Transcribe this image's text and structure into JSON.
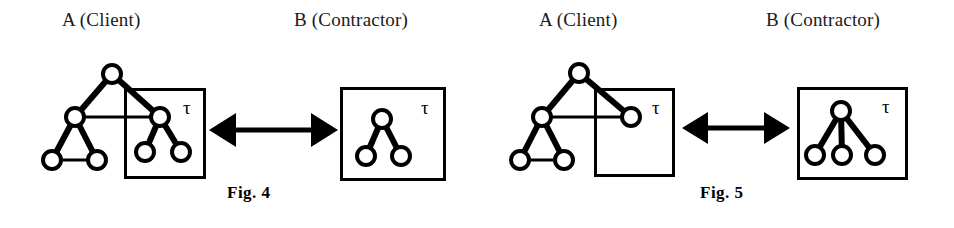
{
  "page": {
    "width": 954,
    "height": 228,
    "background": "#ffffff",
    "ink": "#000000"
  },
  "figures": [
    {
      "id": "fig4",
      "caption": "Fig.  4",
      "caption_x": 227,
      "caption_y": 183,
      "labels": {
        "client": "A (Client)",
        "client_x": 62,
        "client_y": 9,
        "contractor": "B (Contractor)",
        "contractor_x": 294,
        "contractor_y": 9
      },
      "client_side": {
        "tau_label": "τ",
        "tau_x": 183,
        "tau_y": 95,
        "box": {
          "x": 124,
          "y": 88,
          "w": 79,
          "h": 88
        },
        "nodes": [
          {
            "id": "root",
            "cx": 112,
            "cy": 74,
            "r": 9
          },
          {
            "id": "mid",
            "cx": 75,
            "cy": 117,
            "r": 9
          },
          {
            "id": "bl",
            "cx": 52,
            "cy": 160,
            "r": 9
          },
          {
            "id": "br",
            "cx": 97,
            "cy": 160,
            "r": 9
          },
          {
            "id": "sub",
            "cx": 160,
            "cy": 117,
            "r": 9
          },
          {
            "id": "subl",
            "cx": 145,
            "cy": 152,
            "r": 9
          },
          {
            "id": "subr",
            "cx": 181,
            "cy": 152,
            "r": 9
          }
        ],
        "edges": [
          {
            "from": "root",
            "to": "mid",
            "weight": "thick"
          },
          {
            "from": "root",
            "to": "sub",
            "weight": "thick"
          },
          {
            "from": "mid",
            "to": "bl",
            "weight": "thick"
          },
          {
            "from": "mid",
            "to": "br",
            "weight": "thick"
          },
          {
            "from": "bl",
            "to": "br",
            "weight": "thin"
          },
          {
            "from": "mid",
            "to": "sub",
            "weight": "thin"
          },
          {
            "from": "sub",
            "to": "subl",
            "weight": "thick"
          },
          {
            "from": "sub",
            "to": "subr",
            "weight": "thick"
          }
        ]
      },
      "contractor_side": {
        "tau_label": "τ",
        "tau_x": 421,
        "tau_y": 95,
        "box": {
          "x": 340,
          "y": 87,
          "w": 103,
          "h": 91
        },
        "nodes": [
          {
            "id": "root",
            "cx": 382,
            "cy": 119,
            "r": 9
          },
          {
            "id": "left",
            "cx": 366,
            "cy": 156,
            "r": 9
          },
          {
            "id": "right",
            "cx": 401,
            "cy": 156,
            "r": 9
          }
        ],
        "edges": [
          {
            "from": "root",
            "to": "left",
            "weight": "thick"
          },
          {
            "from": "root",
            "to": "right",
            "weight": "thick"
          }
        ]
      },
      "arrow": {
        "x1": 209,
        "x2": 338,
        "y": 130,
        "head": 17,
        "shaft": 5
      }
    },
    {
      "id": "fig5",
      "caption": "Fig.  5",
      "caption_x": 700,
      "caption_y": 183,
      "labels": {
        "client": "A (Client)",
        "client_x": 539,
        "client_y": 9,
        "contractor": "B (Contractor)",
        "contractor_x": 766,
        "contractor_y": 9
      },
      "client_side": {
        "tau_label": "τ",
        "tau_x": 652,
        "tau_y": 95,
        "box": {
          "x": 594,
          "y": 88,
          "w": 78,
          "h": 86
        },
        "nodes": [
          {
            "id": "root",
            "cx": 579,
            "cy": 73,
            "r": 9
          },
          {
            "id": "mid",
            "cx": 542,
            "cy": 117,
            "r": 9
          },
          {
            "id": "bl",
            "cx": 520,
            "cy": 160,
            "r": 9
          },
          {
            "id": "br",
            "cx": 564,
            "cy": 160,
            "r": 9
          },
          {
            "id": "sub",
            "cx": 631,
            "cy": 117,
            "r": 9
          }
        ],
        "edges": [
          {
            "from": "root",
            "to": "mid",
            "weight": "thick"
          },
          {
            "from": "root",
            "to": "sub",
            "weight": "thick"
          },
          {
            "from": "mid",
            "to": "bl",
            "weight": "thick"
          },
          {
            "from": "mid",
            "to": "br",
            "weight": "thick"
          },
          {
            "from": "bl",
            "to": "br",
            "weight": "thin"
          },
          {
            "from": "mid",
            "to": "sub",
            "weight": "thin"
          }
        ]
      },
      "contractor_side": {
        "tau_label": "τ",
        "tau_x": 882,
        "tau_y": 94,
        "box": {
          "x": 797,
          "y": 87,
          "w": 108,
          "h": 90
        },
        "nodes": [
          {
            "id": "root",
            "cx": 841,
            "cy": 111,
            "r": 9
          },
          {
            "id": "left",
            "cx": 815,
            "cy": 155,
            "r": 9
          },
          {
            "id": "mid",
            "cx": 842,
            "cy": 155,
            "r": 9
          },
          {
            "id": "right",
            "cx": 875,
            "cy": 155,
            "r": 9
          }
        ],
        "edges": [
          {
            "from": "root",
            "to": "left",
            "weight": "thick"
          },
          {
            "from": "root",
            "to": "mid",
            "weight": "thick"
          },
          {
            "from": "root",
            "to": "right",
            "weight": "thick"
          }
        ]
      },
      "arrow": {
        "x1": 682,
        "x2": 790,
        "y": 128,
        "head": 16,
        "shaft": 5
      }
    }
  ],
  "style": {
    "node_stroke_width": 4,
    "edge_thick_width": 6,
    "edge_thin_width": 3,
    "box_stroke_width": 3,
    "node_fill": "#ffffff",
    "tau_font_size": 19
  }
}
